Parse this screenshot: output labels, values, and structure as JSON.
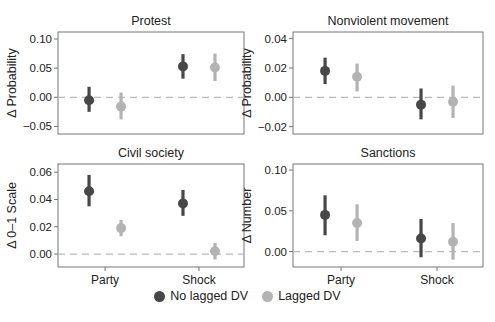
{
  "colors": {
    "no_lagged": "#474747",
    "lagged": "#b3b3b3",
    "axis": "#777777",
    "zero_line": "#bbbbbb"
  },
  "legend": {
    "items": [
      {
        "label": "No lagged DV",
        "series": "no_lagged"
      },
      {
        "label": "Lagged DV",
        "series": "lagged"
      }
    ]
  },
  "chart_data": [
    {
      "type": "scatter",
      "title": "Protest",
      "ylabel": "Δ Probability",
      "xlabel": "",
      "categories": [
        "Party",
        "Shock"
      ],
      "show_x_ticks": false,
      "yticks": [
        -0.05,
        0.0,
        0.05,
        0.1
      ],
      "ytick_labels": [
        "−0.05",
        "0.00",
        "0.05",
        "0.10"
      ],
      "ylim": [
        -0.063,
        0.112
      ],
      "series": [
        {
          "name": "No lagged DV",
          "values": [
            -0.005,
            0.053
          ],
          "lower": [
            -0.025,
            0.032
          ],
          "upper": [
            0.018,
            0.074
          ]
        },
        {
          "name": "Lagged DV",
          "values": [
            -0.016,
            0.051
          ],
          "lower": [
            -0.038,
            0.028
          ],
          "upper": [
            0.008,
            0.075
          ]
        }
      ],
      "reference_line": 0,
      "grid": false
    },
    {
      "type": "scatter",
      "title": "Nonviolent movement",
      "ylabel": "Δ Probability",
      "xlabel": "",
      "categories": [
        "Party",
        "Shock"
      ],
      "show_x_ticks": false,
      "yticks": [
        -0.02,
        0.0,
        0.02,
        0.04
      ],
      "ytick_labels": [
        "−0.02",
        "0.00",
        "0.02",
        "0.04"
      ],
      "ylim": [
        -0.025,
        0.0445
      ],
      "series": [
        {
          "name": "No lagged DV",
          "values": [
            0.018,
            -0.005
          ],
          "lower": [
            0.009,
            -0.015
          ],
          "upper": [
            0.027,
            0.006
          ]
        },
        {
          "name": "Lagged DV",
          "values": [
            0.014,
            -0.003
          ],
          "lower": [
            0.004,
            -0.014
          ],
          "upper": [
            0.023,
            0.008
          ]
        }
      ],
      "reference_line": 0,
      "grid": false
    },
    {
      "type": "scatter",
      "title": "Civil society",
      "ylabel": "Δ 0–1 Scale",
      "xlabel": "",
      "categories": [
        "Party",
        "Shock"
      ],
      "show_x_ticks": true,
      "yticks": [
        0.0,
        0.02,
        0.04,
        0.06
      ],
      "ytick_labels": [
        "0.00",
        "0.02",
        "0.04",
        "0.06"
      ],
      "ylim": [
        -0.0095,
        0.066
      ],
      "series": [
        {
          "name": "No lagged DV",
          "values": [
            0.046,
            0.037
          ],
          "lower": [
            0.035,
            0.028
          ],
          "upper": [
            0.058,
            0.047
          ]
        },
        {
          "name": "Lagged DV",
          "values": [
            0.019,
            0.002
          ],
          "lower": [
            0.013,
            -0.004
          ],
          "upper": [
            0.025,
            0.008
          ]
        }
      ],
      "reference_line": 0,
      "grid": false
    },
    {
      "type": "scatter",
      "title": "Sanctions",
      "ylabel": "Δ Number",
      "xlabel": "",
      "categories": [
        "Party",
        "Shock"
      ],
      "show_x_ticks": true,
      "yticks": [
        0.0,
        0.05,
        0.1
      ],
      "ytick_labels": [
        "0.00",
        "0.05",
        "0.10"
      ],
      "ylim": [
        -0.019,
        0.1075
      ],
      "series": [
        {
          "name": "No lagged DV",
          "values": [
            0.045,
            0.016
          ],
          "lower": [
            0.02,
            -0.007
          ],
          "upper": [
            0.069,
            0.04
          ]
        },
        {
          "name": "Lagged DV",
          "values": [
            0.035,
            0.012
          ],
          "lower": [
            0.013,
            -0.01
          ],
          "upper": [
            0.058,
            0.035
          ]
        }
      ],
      "reference_line": 0,
      "grid": false
    }
  ]
}
